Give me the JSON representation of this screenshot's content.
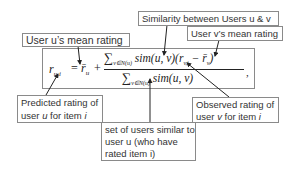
{
  "formula": {
    "lhs": "r",
    "lhs_sub": "u,i",
    "equals": "=",
    "mean_u": "r̄",
    "mean_u_sub": "u",
    "plus": "+",
    "numerator_sum": "∑",
    "numerator_sum_sub": "v∈N(u)",
    "numerator_body": "sim(u, v)(r",
    "numerator_r_sub": "v,i",
    "numerator_minus": " − r̄",
    "numerator_mean_sub": "v",
    "numerator_close": ")",
    "denominator_sum": "∑",
    "denominator_sum_sub": "v∈N(u)",
    "denominator_body": "sim(u, v)",
    "trailing": ","
  },
  "labels": {
    "mean_u": "User u’s mean rating",
    "similarity": "Similarity between Users u & v",
    "mean_v": "User v’s mean rating",
    "predicted_line1": "Predicted rating of",
    "predicted_line2_a": "user ",
    "predicted_line2_u": "u",
    "predicted_line2_b": " for item ",
    "predicted_line2_i": "i",
    "neighbors_line1": "set of users similar to",
    "neighbors_line2": "user u (who have",
    "neighbors_line3": "rated item i)",
    "observed_line1": "Observed rating of",
    "observed_line2_a": "user ",
    "observed_line2_v": "v",
    "observed_line2_b": " for item ",
    "observed_line2_i": "i"
  },
  "colors": {
    "border": "#8a8a8a",
    "text": "#333333",
    "arrow": "#222222"
  }
}
